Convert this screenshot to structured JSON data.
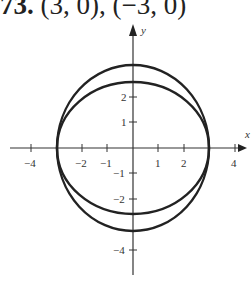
{
  "problem": {
    "number": "73.",
    "answer": "(3, 0), (−3, 0)"
  },
  "graph": {
    "x_axis_label": "x",
    "y_axis_label": "y",
    "x_ticks": [
      "−4",
      "−2",
      "−1",
      "1",
      "2",
      "4"
    ],
    "y_ticks": [
      "2",
      "1",
      "−1",
      "−2",
      "−4"
    ],
    "curves": [
      {
        "type": "ellipse",
        "a": 3,
        "b": 3.25
      },
      {
        "type": "ellipse",
        "a": 3,
        "b": 2.6
      }
    ],
    "intersections": [
      "(3, 0)",
      "(−3, 0)"
    ]
  }
}
